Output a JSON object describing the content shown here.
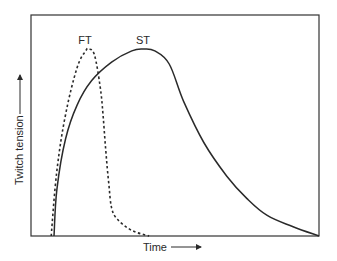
{
  "chart_data": {
    "type": "line",
    "title": "",
    "xlabel": "Time",
    "ylabel": "Twitch tension",
    "grid": false,
    "legend": "inline labels near curve peaks",
    "x_ticks": [],
    "y_ticks": [],
    "xlim": [
      0,
      100
    ],
    "ylim": [
      0,
      100
    ],
    "series": [
      {
        "name": "FT",
        "style": "dashed",
        "x": [
          7,
          9,
          12,
          16,
          19,
          20,
          22,
          24,
          25,
          26,
          27,
          28,
          30,
          35,
          41
        ],
        "y": [
          0,
          35,
          65,
          90,
          99,
          100,
          97,
          80,
          65,
          45,
          28,
          15,
          9,
          3,
          0
        ]
      },
      {
        "name": "ST",
        "style": "solid",
        "x": [
          8,
          9,
          12,
          16,
          21,
          28,
          35,
          39,
          43,
          48,
          53,
          60,
          68,
          75,
          82,
          91,
          100
        ],
        "y": [
          0,
          25,
          52,
          70,
          83,
          93,
          99,
          100,
          99,
          92,
          72,
          50,
          32,
          20,
          11,
          5,
          0
        ]
      }
    ],
    "annotations": [
      {
        "text": "FT",
        "near": "FT peak"
      },
      {
        "text": "ST",
        "near": "ST peak"
      }
    ]
  },
  "labels": {
    "ft": "FT",
    "st": "ST",
    "xlabel": "Time",
    "ylabel": "Twitch tension"
  },
  "colors": {
    "line": "#2a2a2a",
    "frame": "#333333",
    "background": "#ffffff"
  }
}
